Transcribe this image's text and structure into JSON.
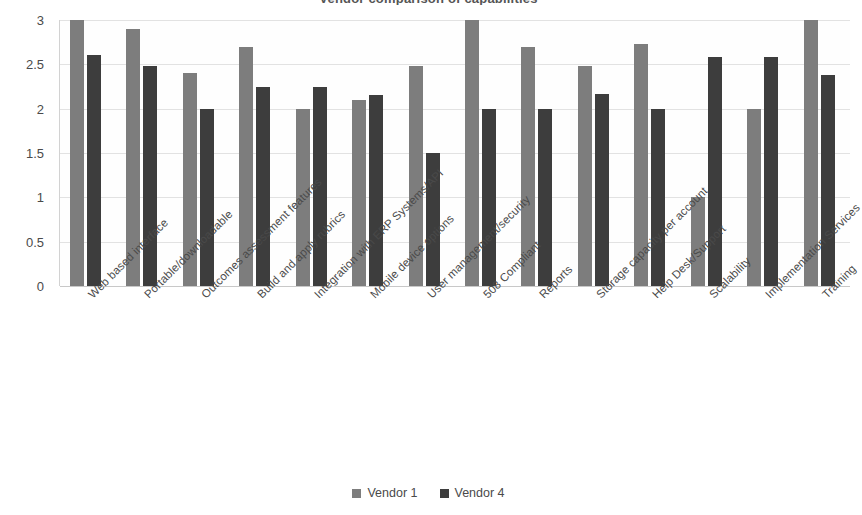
{
  "chart_data": {
    "type": "bar",
    "title": "Vendor comparison of capabilities",
    "xlabel": "",
    "ylabel": "",
    "ylim": [
      0,
      3
    ],
    "ytick_step": 0.5,
    "yticks": [
      "3",
      "2.5",
      "2",
      "1.5",
      "1",
      "0.5",
      "0"
    ],
    "grid": true,
    "legend_position": "bottom",
    "categories": [
      "Web based interface",
      "Portable/downloadable",
      "Outcomes assessment features",
      "Build and apply rubrics",
      "Integration with ERP Systems/API",
      "Mobile device options",
      "User management/security",
      "508 Compliant",
      "Reports",
      "Storage capacity per account",
      "Help Desk/Support",
      "Scalability",
      "Implementation Services",
      "Training"
    ],
    "series": [
      {
        "name": "Vendor 1",
        "color": "#7d7d7d",
        "values": [
          3.0,
          2.9,
          2.4,
          2.7,
          2.0,
          2.1,
          2.48,
          3.0,
          2.7,
          2.48,
          2.73,
          1.0,
          2.0,
          3.0
        ]
      },
      {
        "name": "Vendor 4",
        "color": "#3d3d3d",
        "values": [
          2.6,
          2.48,
          2.0,
          2.25,
          2.25,
          2.15,
          1.5,
          2.0,
          2.0,
          2.17,
          2.0,
          2.58,
          2.58,
          2.38
        ]
      }
    ]
  },
  "legend": {
    "items": [
      {
        "label": "Vendor 1",
        "color": "#7d7d7d"
      },
      {
        "label": "Vendor 4",
        "color": "#3d3d3d"
      }
    ]
  }
}
